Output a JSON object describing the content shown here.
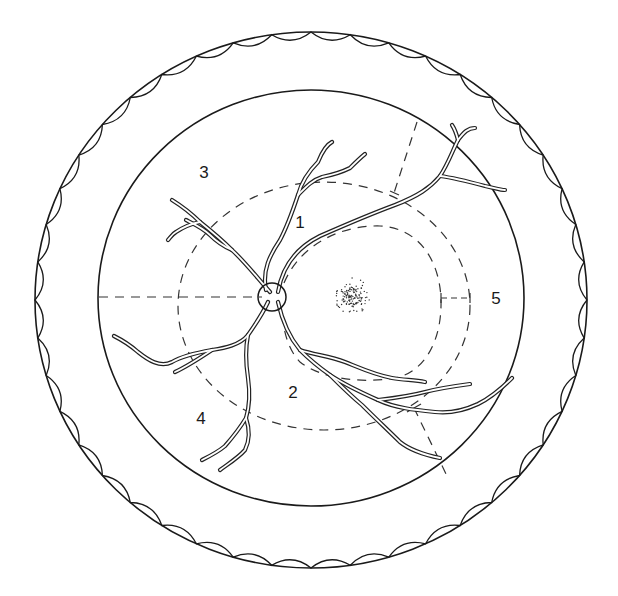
{
  "figure": {
    "stroke_color": "#1a1a1a",
    "background": "#ffffff"
  },
  "labels": [
    {
      "id": "zone-1",
      "text": "1",
      "x": 300,
      "y": 222
    },
    {
      "id": "zone-2",
      "text": "2",
      "x": 293,
      "y": 392
    },
    {
      "id": "zone-3",
      "text": "3",
      "x": 204,
      "y": 172
    },
    {
      "id": "zone-4",
      "text": "4",
      "x": 201,
      "y": 418
    },
    {
      "id": "zone-5",
      "text": "5",
      "x": 496,
      "y": 298
    }
  ],
  "structures": {
    "outer_circle": {
      "cx": 311,
      "cy": 300,
      "rx": 276,
      "ry": 268,
      "edge": "scalloped inner border"
    },
    "inner_circle": {
      "cx": 311,
      "cy": 298,
      "rx": 213,
      "ry": 208
    },
    "optic_disc": {
      "cx": 272,
      "cy": 297,
      "r": 14
    },
    "fovea": {
      "cx": 352,
      "cy": 296,
      "r": 18,
      "style": "stippled"
    },
    "outer_dashed_ellipse": {
      "cx": 324,
      "cy": 306,
      "rx": 146,
      "ry": 124
    },
    "macular_dashed_boundary": "D-shaped dashed curve from disc to x=440",
    "horizontal_meridian": "dashed line from inner circle edge to optic disc",
    "radial_dividers": [
      "upper-right dashed radial",
      "lower-right dashed radial",
      "zone 5 tick marker"
    ]
  }
}
